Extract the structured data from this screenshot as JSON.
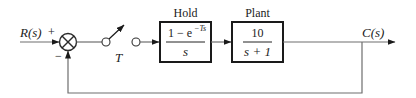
{
  "diagram": {
    "type": "block-diagram",
    "input": {
      "label": "R(s)",
      "sign": "+"
    },
    "summing_junction": {
      "plus": "+",
      "minus": "−"
    },
    "sampler": {
      "label": "T"
    },
    "blocks": [
      {
        "title": "Hold",
        "numerator": "1 − e",
        "numerator_exp": "−Ts",
        "denominator": "s"
      },
      {
        "title": "Plant",
        "numerator": "10",
        "denominator": "s + 1"
      }
    ],
    "output": {
      "label": "C(s)"
    },
    "feedback": {
      "type": "unity",
      "sign": "−"
    },
    "colors": {
      "lines": "#6e6e6e",
      "blocks": "#1a1a1a",
      "text": "#222222",
      "background": "#ffffff"
    }
  }
}
